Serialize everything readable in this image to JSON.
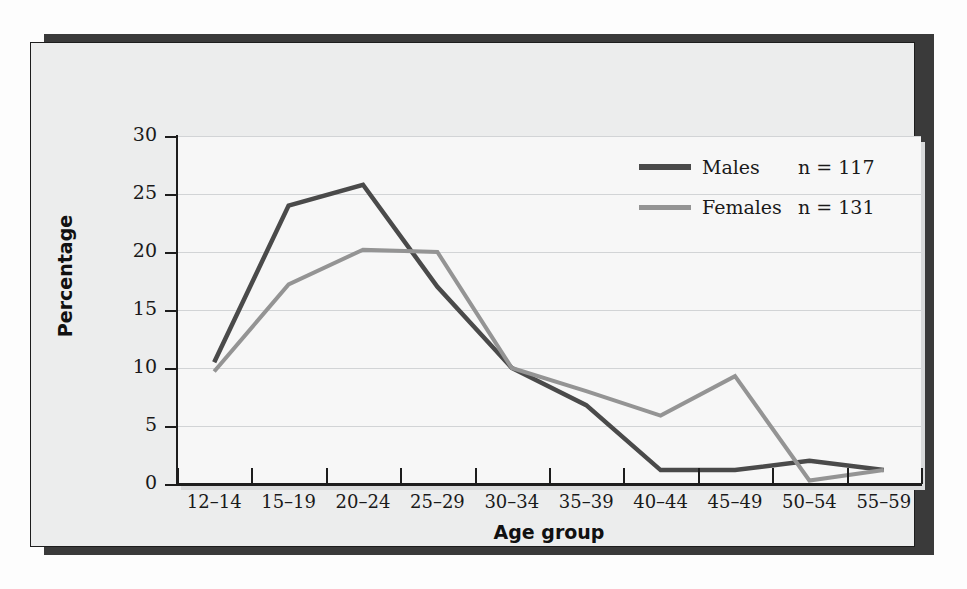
{
  "figure": {
    "y_axis_title": "Percentage",
    "x_axis_title": "Age group"
  },
  "legend": {
    "position": "top-right",
    "entries": [
      {
        "label": "Males",
        "n_text": "n = 117",
        "color": "#4a4a4a",
        "n": 117
      },
      {
        "label": "Females",
        "n_text": "n = 131",
        "color": "#949494",
        "n": 131
      }
    ]
  },
  "chart_data": {
    "type": "line",
    "title": "",
    "subtitle": "",
    "xlabel": "Age group",
    "ylabel": "Percentage",
    "categories": [
      "12–14",
      "15–19",
      "20–24",
      "25–29",
      "30–34",
      "35–39",
      "40–44",
      "45–49",
      "50–54",
      "55–59"
    ],
    "ylim": [
      0,
      30
    ],
    "yticks": [
      0,
      5,
      10,
      15,
      20,
      25,
      30
    ],
    "ytick_labels": [
      "0",
      "5",
      "10",
      "15",
      "20",
      "25",
      "30"
    ],
    "grid": true,
    "grid_axis": "y",
    "legend_position": "upper right",
    "series": [
      {
        "name": "Males",
        "color": "#4a4a4a",
        "line_width": 4.5,
        "n": 117,
        "values": [
          10.5,
          24.0,
          25.8,
          17.0,
          10.0,
          6.8,
          1.2,
          1.2,
          2.0,
          1.2
        ]
      },
      {
        "name": "Females",
        "color": "#949494",
        "line_width": 4.0,
        "n": 131,
        "values": [
          9.7,
          17.2,
          20.2,
          20.0,
          10.0,
          8.0,
          5.9,
          9.3,
          0.3,
          1.2
        ]
      }
    ]
  }
}
